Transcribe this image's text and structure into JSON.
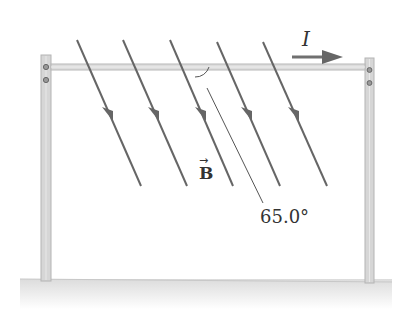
{
  "figure": {
    "current_label": "I",
    "field_label": "B",
    "field_vector_symbol": "→",
    "angle_label": "65.0°"
  },
  "colors": {
    "line": "#666666",
    "post": "#d4d4d4",
    "post_edge": "#b0b0b0",
    "bar": "#d8d8d8",
    "ground": "#e6e6e6",
    "text": "#333333"
  },
  "geometry": {
    "field_lines": [
      {
        "x1": 77,
        "y1": 40,
        "x2": 141,
        "y2": 186
      },
      {
        "x1": 123,
        "y1": 40,
        "x2": 187,
        "y2": 186
      },
      {
        "x1": 170,
        "y1": 40,
        "x2": 233,
        "y2": 186
      },
      {
        "x1": 217,
        "y1": 42,
        "x2": 280,
        "y2": 186
      },
      {
        "x1": 263,
        "y1": 42,
        "x2": 327,
        "y2": 186
      }
    ],
    "angle_deg": 65.0
  }
}
